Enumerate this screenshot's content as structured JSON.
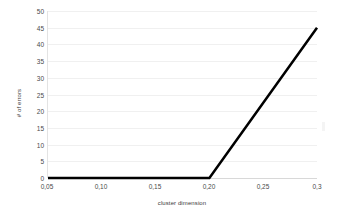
{
  "chart_data": {
    "type": "line",
    "title": "",
    "xlabel": "cluster dimension",
    "ylabel": "# of errors",
    "x": [
      0.05,
      0.2,
      0.3
    ],
    "values": [
      0,
      0,
      45
    ],
    "series": [
      {
        "name": "# of errors",
        "x": [
          0.05,
          0.2,
          0.3
        ],
        "values": [
          0,
          0,
          45
        ],
        "color": "#000000"
      }
    ],
    "xlim": [
      0.05,
      0.3
    ],
    "ylim": [
      0,
      50
    ],
    "x_tick_values": [
      0.05,
      0.1,
      0.15,
      0.2,
      0.25,
      0.3
    ],
    "x_tick_labels": [
      "0,05",
      "0,10",
      "0,15",
      "0,20",
      "0,25",
      "0,3"
    ],
    "y_tick_values": [
      0,
      5,
      10,
      15,
      20,
      25,
      30,
      35,
      40,
      45,
      50
    ],
    "y_tick_labels": [
      "0",
      "5",
      "10",
      "15",
      "20",
      "25",
      "30",
      "35",
      "40",
      "45",
      "50"
    ],
    "grid": {
      "horizontal": true,
      "vertical": false,
      "color": "#f0f0f0"
    },
    "legend": {
      "visible": false,
      "position": "none"
    },
    "annotations": [],
    "background_color": "#ffffff",
    "line_color": "#000000",
    "line_width": 2.5,
    "axis_color": "#e3e3e3",
    "tick_label_color": "#4a4a4a"
  }
}
